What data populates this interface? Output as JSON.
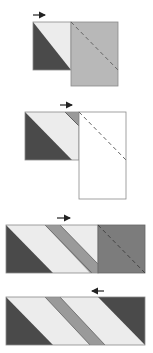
{
  "diagram": {
    "colors": {
      "dark": "#4a4a4a",
      "light": "#ececec",
      "medium": "#9a9a9a",
      "gray_rect": "#b8b8b8",
      "dark_square": "#7c7c7c",
      "white": "#ffffff",
      "outline": "#8a8a8a",
      "arrow": "#222222",
      "dash": "#666666"
    },
    "steps": [
      {
        "id": 1,
        "arrow_direction": "right"
      },
      {
        "id": 2,
        "arrow_direction": "right"
      },
      {
        "id": 3,
        "arrow_direction": "right"
      },
      {
        "id": 4,
        "arrow_direction": "left"
      }
    ]
  }
}
